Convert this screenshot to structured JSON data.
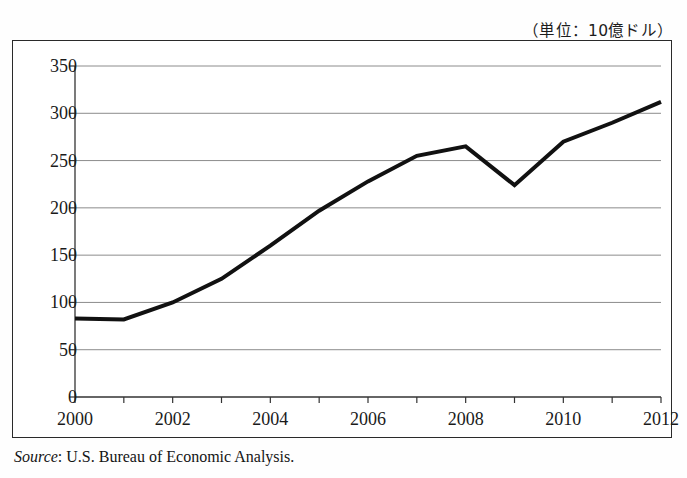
{
  "unit_caption": "（単位：10億ドル）",
  "source": {
    "label": "Source",
    "separator": ": ",
    "text": "U.S. Bureau of Economic Analysis."
  },
  "colors": {
    "line": "#111111",
    "grid": "#8c8c8c",
    "axis": "#333333",
    "frame": "#2a2a2a",
    "background": "#ffffff"
  },
  "chart_data": {
    "type": "line",
    "title": "",
    "subtitle": "",
    "xlabel": "",
    "ylabel": "",
    "unit_note": "（単位：10億ドル）",
    "x": [
      2000,
      2001,
      2002,
      2003,
      2004,
      2005,
      2006,
      2007,
      2008,
      2009,
      2010,
      2011,
      2012
    ],
    "series": [
      {
        "name": "value",
        "values": [
          83,
          82,
          100,
          125,
          160,
          197,
          228,
          255,
          265,
          224,
          270,
          290,
          312
        ]
      }
    ],
    "xlim": [
      2000,
      2012
    ],
    "ylim": [
      0,
      350
    ],
    "ytick_values": [
      0,
      50,
      100,
      150,
      200,
      250,
      300,
      350
    ],
    "ytick_labels": [
      "0",
      "50",
      "100",
      "150",
      "200",
      "250",
      "300",
      "350"
    ],
    "xtick_values": [
      2000,
      2002,
      2004,
      2006,
      2008,
      2010,
      2012
    ],
    "xtick_labels": [
      "2000",
      "2002",
      "2004",
      "2006",
      "2008",
      "2010",
      "2012"
    ],
    "xminor_tick_values": [
      2000,
      2001,
      2002,
      2003,
      2004,
      2005,
      2006,
      2007,
      2008,
      2009,
      2010,
      2011,
      2012
    ],
    "grid": {
      "horizontal": true,
      "vertical": false
    },
    "legend": {
      "visible": false,
      "position": "none"
    },
    "markers": false,
    "line_width": 4
  }
}
